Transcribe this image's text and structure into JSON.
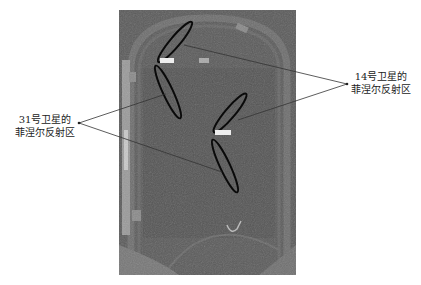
{
  "figure": {
    "type": "annotated aerial satellite image of a sports field / running track",
    "photo_colors": {
      "base": "#5d5d5d",
      "track": "#6a6a6a",
      "field": "#575757",
      "ellipse_stroke": "#0a0a0a",
      "leader_line": "#333333"
    }
  },
  "labels": {
    "sat31": {
      "line1": "31号卫星的",
      "line2": "菲涅尔反射区"
    },
    "sat14": {
      "line1": "14号卫星的",
      "line2": "菲涅尔反射区"
    }
  },
  "fresnel_zones": [
    {
      "satellite": "31",
      "index": 1,
      "cx": 168,
      "cy": 92,
      "rx": 29,
      "ry": 5,
      "rotate": 65
    },
    {
      "satellite": "31",
      "index": 2,
      "cx": 225,
      "cy": 166,
      "rx": 29,
      "ry": 5,
      "rotate": 65
    },
    {
      "satellite": "14",
      "index": 1,
      "cx": 175,
      "cy": 42,
      "rx": 26,
      "ry": 5,
      "rotate": -50
    },
    {
      "satellite": "14",
      "index": 2,
      "cx": 230,
      "cy": 113,
      "rx": 25,
      "ry": 5,
      "rotate": -50
    }
  ],
  "caption": ""
}
